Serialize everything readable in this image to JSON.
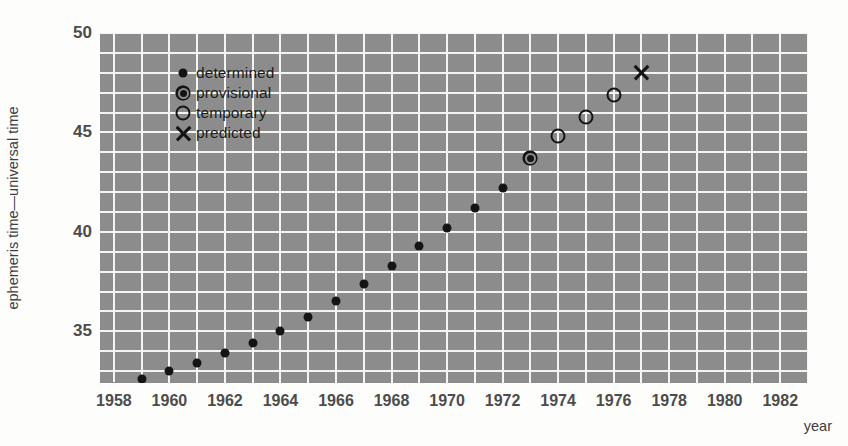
{
  "chart_data": {
    "type": "scatter",
    "title": "",
    "xlabel": "year",
    "ylabel": "ephemeris time—universal time",
    "xlim": [
      1957.5,
      1983.0
    ],
    "ylim": [
      32.4,
      50.0
    ],
    "grid": true,
    "grid_x_step": 1,
    "grid_y_step": 1,
    "legend_position": "upper-left-inside",
    "x_ticks": [
      "1958",
      "1960",
      "1962",
      "1964",
      "1966",
      "1968",
      "1970",
      "1972",
      "1974",
      "1976",
      "1978",
      "1980",
      "1982"
    ],
    "x_tick_values": [
      1958,
      1960,
      1962,
      1964,
      1966,
      1968,
      1970,
      1972,
      1974,
      1976,
      1978,
      1980,
      1982
    ],
    "y_ticks": [
      "50",
      "45",
      "40",
      "35"
    ],
    "y_tick_values": [
      50,
      45,
      40,
      35
    ],
    "series": [
      {
        "name": "determined",
        "marker": "filled-dot",
        "points": [
          {
            "x": 1958,
            "y": 32.2
          },
          {
            "x": 1959,
            "y": 32.6
          },
          {
            "x": 1960,
            "y": 33.0
          },
          {
            "x": 1961,
            "y": 33.4
          },
          {
            "x": 1962,
            "y": 33.9
          },
          {
            "x": 1963,
            "y": 34.4
          },
          {
            "x": 1964,
            "y": 35.0
          },
          {
            "x": 1965,
            "y": 35.7
          },
          {
            "x": 1966,
            "y": 36.5
          },
          {
            "x": 1967,
            "y": 37.4
          },
          {
            "x": 1968,
            "y": 38.3
          },
          {
            "x": 1969,
            "y": 39.3
          },
          {
            "x": 1970,
            "y": 40.2
          },
          {
            "x": 1971,
            "y": 41.2
          },
          {
            "x": 1972,
            "y": 42.2
          }
        ]
      },
      {
        "name": "provisional",
        "marker": "ringed-dot",
        "points": [
          {
            "x": 1973,
            "y": 43.7
          }
        ]
      },
      {
        "name": "temporary",
        "marker": "open-circle",
        "points": [
          {
            "x": 1974,
            "y": 44.8
          },
          {
            "x": 1975,
            "y": 45.8
          },
          {
            "x": 1976,
            "y": 46.9
          }
        ]
      },
      {
        "name": "predicted",
        "marker": "cross",
        "points": [
          {
            "x": 1977,
            "y": 48.0
          }
        ]
      }
    ]
  },
  "legend": {
    "items": [
      {
        "label": "determined",
        "marker": "filled-dot"
      },
      {
        "label": "provisional",
        "marker": "ringed-dot"
      },
      {
        "label": "temporary",
        "marker": "open-circle"
      },
      {
        "label": "predicted",
        "marker": "cross"
      }
    ]
  },
  "colors": {
    "plot_background": "#8c8c8c",
    "gridline": "#f4f4f2",
    "marker": "#141414",
    "axis_text": "#4c4c4c",
    "label_text": "#3d3d3d",
    "page_background": "#fdfdfb"
  }
}
